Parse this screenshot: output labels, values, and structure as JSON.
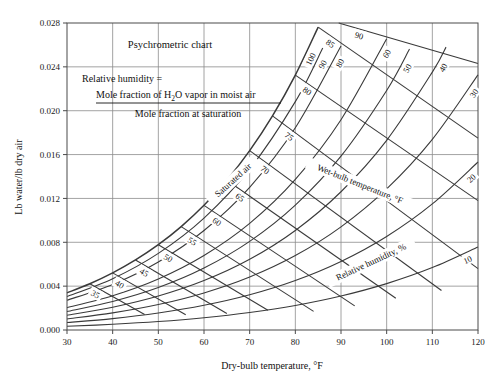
{
  "chart_data": {
    "type": "line",
    "title": "Psychrometric chart",
    "xlabel": "Dry-bulb temperature, °F",
    "ylabel": "Lb water/lb dry air",
    "xlim": [
      30,
      120
    ],
    "ylim": [
      0,
      0.028
    ],
    "xticks": [
      30,
      40,
      50,
      60,
      70,
      80,
      90,
      100,
      110,
      120
    ],
    "yticks": [
      "0.000",
      "0.004",
      "0.008",
      "0.012",
      "0.016",
      "0.020",
      "0.024",
      "0.028"
    ],
    "ytick_values": [
      0,
      0.004,
      0.008,
      0.012,
      0.016,
      0.02,
      0.024,
      0.028
    ],
    "grid": true,
    "legend": "none",
    "pressure_psia": 14.696,
    "series": [
      {
        "name": "Saturation curve (100% relative humidity)",
        "label": "100",
        "rh_percent": 100,
        "x": [
          30,
          35,
          40,
          45,
          50,
          55,
          60,
          65,
          70,
          75,
          80,
          85
        ],
        "values": [
          0.00339,
          0.00422,
          0.00521,
          0.00639,
          0.00778,
          0.00943,
          0.01137,
          0.01366,
          0.01636,
          0.01953,
          0.02325,
          0.02762
        ]
      },
      {
        "name": "Relative humidity 90%",
        "label": "90",
        "rh_percent": 90,
        "x": [
          30,
          40,
          50,
          60,
          70,
          80,
          86
        ],
        "values": [
          0.00305,
          0.00468,
          0.00699,
          0.01021,
          0.01467,
          0.02083,
          0.02572
        ]
      },
      {
        "name": "Relative humidity 80%",
        "label": "80",
        "rh_percent": 80,
        "x": [
          30,
          40,
          50,
          60,
          70,
          80,
          90,
          94
        ],
        "values": [
          0.00271,
          0.00416,
          0.00621,
          0.00907,
          0.01301,
          0.01844,
          0.0259,
          0.0295
        ]
      },
      {
        "name": "Relative humidity 60%",
        "label": "60",
        "rh_percent": 60,
        "x": [
          30,
          40,
          50,
          60,
          70,
          80,
          90,
          100
        ],
        "values": [
          0.00203,
          0.00312,
          0.00465,
          0.00679,
          0.00972,
          0.01373,
          0.01918,
          0.02657
        ]
      },
      {
        "name": "Relative humidity 50%",
        "label": "50",
        "rh_percent": 50,
        "x": [
          30,
          40,
          50,
          60,
          70,
          80,
          90,
          100,
          105
        ],
        "values": [
          0.00169,
          0.0026,
          0.00387,
          0.00565,
          0.00808,
          0.01139,
          0.01586,
          0.02185,
          0.02562
        ]
      },
      {
        "name": "Relative humidity 40%",
        "label": "40",
        "rh_percent": 40,
        "x": [
          30,
          40,
          50,
          60,
          70,
          80,
          90,
          100,
          110,
          113
        ],
        "values": [
          0.00135,
          0.00208,
          0.0031,
          0.00451,
          0.00645,
          0.00908,
          0.01261,
          0.0173,
          0.02352,
          0.0258
        ]
      },
      {
        "name": "Relative humidity 30%",
        "label": "30",
        "rh_percent": 30,
        "x": [
          30,
          40,
          50,
          60,
          70,
          80,
          90,
          100,
          110,
          120
        ],
        "values": [
          0.00101,
          0.00156,
          0.00232,
          0.00338,
          0.00483,
          0.00679,
          0.00941,
          0.01287,
          0.01739,
          0.02327
        ]
      },
      {
        "name": "Relative humidity 20%",
        "label": "20",
        "rh_percent": 20,
        "x": [
          30,
          40,
          50,
          60,
          70,
          80,
          90,
          100,
          110,
          120
        ],
        "values": [
          0.00068,
          0.00104,
          0.00155,
          0.00225,
          0.00321,
          0.00451,
          0.00625,
          0.00853,
          0.0115,
          0.01532
        ]
      },
      {
        "name": "Relative humidity 10%",
        "label": "10",
        "rh_percent": 10,
        "x": [
          30,
          40,
          50,
          60,
          70,
          80,
          90,
          100,
          110,
          120
        ],
        "values": [
          0.00034,
          0.00052,
          0.00077,
          0.00112,
          0.0016,
          0.00224,
          0.0031,
          0.00423,
          0.00569,
          0.00757
        ]
      }
    ],
    "wetbulb_lines": [
      {
        "label": "35",
        "wb_temp": 35,
        "x_start": 35,
        "y_start": 0.00422,
        "x_end": 47,
        "y_end": 0.00142
      },
      {
        "label": "40",
        "wb_temp": 40,
        "x_start": 40,
        "y_start": 0.00521,
        "x_end": 56,
        "y_end": 0.00139
      },
      {
        "label": "45",
        "wb_temp": 45,
        "x_start": 45,
        "y_start": 0.00639,
        "x_end": 65,
        "y_end": 0.00151
      },
      {
        "label": "50",
        "wb_temp": 50,
        "x_start": 50,
        "y_start": 0.00778,
        "x_end": 74,
        "y_end": 0.0018
      },
      {
        "label": "55",
        "wb_temp": 55,
        "x_start": 55,
        "y_start": 0.00943,
        "x_end": 84,
        "y_end": 0.0017
      },
      {
        "label": "60",
        "wb_temp": 60,
        "x_start": 60,
        "y_start": 0.01137,
        "x_end": 93,
        "y_end": 0.0022
      },
      {
        "label": "65",
        "wb_temp": 65,
        "x_start": 65,
        "y_start": 0.01366,
        "x_end": 102,
        "y_end": 0.0029
      },
      {
        "label": "70",
        "wb_temp": 70,
        "x_start": 70,
        "y_start": 0.01636,
        "x_end": 112,
        "y_end": 0.0036
      },
      {
        "label": "75",
        "wb_temp": 75,
        "x_start": 75,
        "y_start": 0.01953,
        "x_end": 120,
        "y_end": 0.0056
      },
      {
        "label": "80",
        "wb_temp": 80,
        "x_start": 80,
        "y_start": 0.02325,
        "x_end": 120,
        "y_end": 0.0118
      },
      {
        "label": "85",
        "wb_temp": 85,
        "x_start": 85,
        "y_start": 0.02762,
        "x_end": 120,
        "y_end": 0.0175
      },
      {
        "label": "90",
        "wb_temp": 90,
        "x_start": 89.5,
        "y_start": 0.028,
        "x_end": 120,
        "y_end": 0.0243
      }
    ],
    "annotations": [
      {
        "name": "saturated-air",
        "text": "Saturated air",
        "rotation": -42
      },
      {
        "name": "wetbulb-axis-label",
        "text": "Wet-bulb temperature, °F",
        "rotation": 22
      },
      {
        "name": "relative-humidity-axis-label",
        "text": "Relative humidity, %",
        "rotation": -25
      }
    ]
  },
  "formula": {
    "lead": "Relative humidity =",
    "numerator_part1": "Mole fraction of H",
    "numerator_sub": "2",
    "numerator_part2": "O vapor in moist air",
    "denominator": "Mole fraction at saturation"
  },
  "colors": {
    "ink": "#1a1a1a",
    "curve": "#3a3a3a",
    "grid": "#8c8c8c",
    "axis": "#4a4a4a",
    "background": "#ffffff"
  }
}
